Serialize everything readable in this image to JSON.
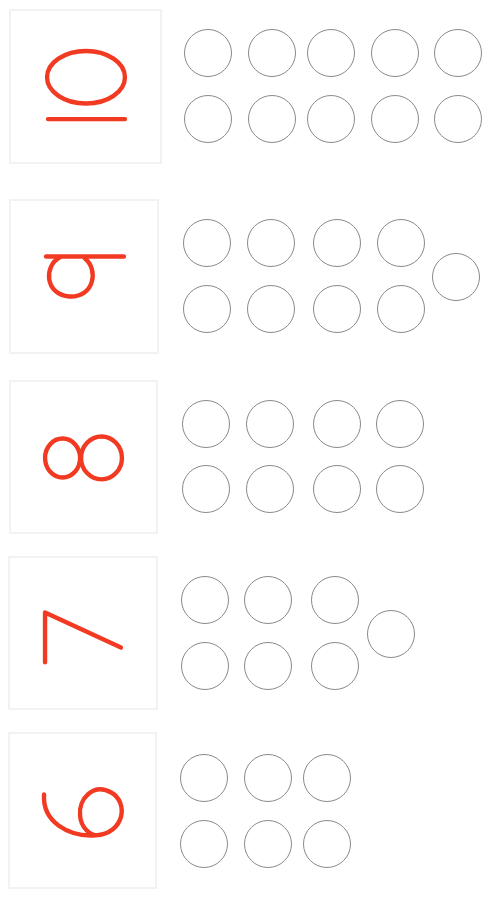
{
  "colors": {
    "digit": "#f23a22",
    "circle_stroke": "#8a8a8a",
    "card_border": "#f1f3f3",
    "background": "#ffffff"
  },
  "rows": [
    {
      "number": "10",
      "label": "10",
      "circle_count": 10,
      "card": {
        "x": 9,
        "y": 9,
        "w": 153,
        "h": 155
      },
      "circles": [
        [
          208,
          53
        ],
        [
          272,
          53
        ],
        [
          331,
          53
        ],
        [
          395,
          53
        ],
        [
          458,
          53
        ],
        [
          208,
          119
        ],
        [
          272,
          119
        ],
        [
          331,
          119
        ],
        [
          395,
          119
        ],
        [
          458,
          119
        ]
      ]
    },
    {
      "number": "9",
      "label": "9",
      "circle_count": 9,
      "card": {
        "x": 9,
        "y": 199,
        "w": 150,
        "h": 155
      },
      "circles": [
        [
          207,
          243
        ],
        [
          271,
          243
        ],
        [
          337,
          243
        ],
        [
          401,
          243
        ],
        [
          207,
          309
        ],
        [
          271,
          309
        ],
        [
          337,
          309
        ],
        [
          401,
          309
        ],
        [
          456,
          277
        ]
      ]
    },
    {
      "number": "8",
      "label": "8",
      "circle_count": 8,
      "card": {
        "x": 9,
        "y": 380,
        "w": 149,
        "h": 154
      },
      "circles": [
        [
          206,
          424
        ],
        [
          270,
          424
        ],
        [
          337,
          424
        ],
        [
          400,
          424
        ],
        [
          206,
          489
        ],
        [
          270,
          489
        ],
        [
          337,
          489
        ],
        [
          400,
          489
        ]
      ]
    },
    {
      "number": "7",
      "label": "7",
      "circle_count": 7,
      "card": {
        "x": 8,
        "y": 556,
        "w": 150,
        "h": 154
      },
      "circles": [
        [
          205,
          600
        ],
        [
          268,
          600
        ],
        [
          335,
          600
        ],
        [
          205,
          666
        ],
        [
          268,
          666
        ],
        [
          335,
          666
        ],
        [
          391,
          634
        ]
      ]
    },
    {
      "number": "6",
      "label": "6",
      "circle_count": 6,
      "card": {
        "x": 8,
        "y": 732,
        "w": 149,
        "h": 157
      },
      "circles": [
        [
          204,
          778
        ],
        [
          268,
          778
        ],
        [
          327,
          778
        ],
        [
          204,
          844
        ],
        [
          268,
          844
        ],
        [
          327,
          844
        ]
      ]
    }
  ]
}
